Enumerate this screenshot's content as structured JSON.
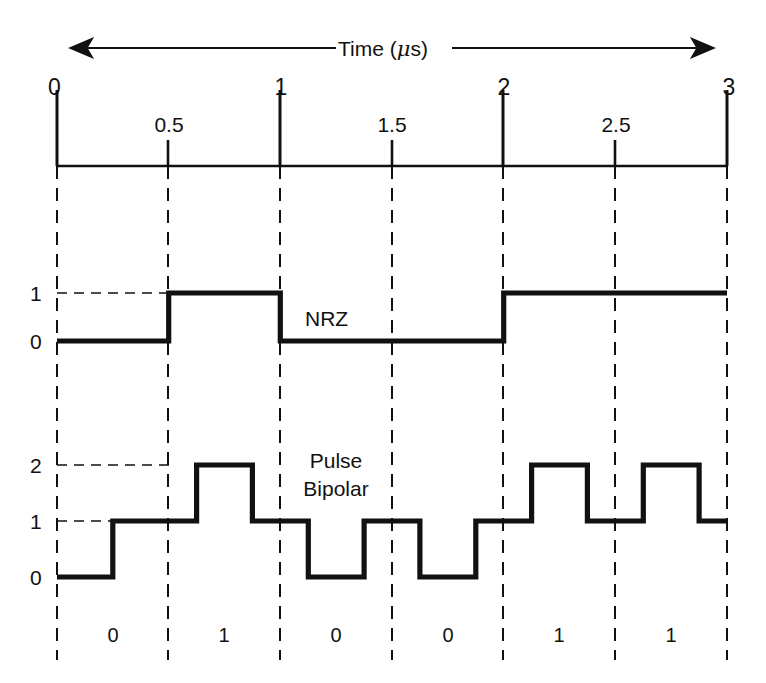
{
  "figure": {
    "background": "#ffffff",
    "ink": "#111111",
    "axis_title": "Time (",
    "axis_title_unit_mu": "μ",
    "axis_title_tail": "s)",
    "axis_title_full": "Time (μs)",
    "arrow_left_icon": "arrow-left-icon",
    "arrow_right_icon": "arrow-right-icon"
  },
  "axis": {
    "label": "Time (μs)",
    "unit": "μs",
    "major_ticks": [
      {
        "value": "0",
        "t": 0.0
      },
      {
        "value": "1",
        "t": 1.0
      },
      {
        "value": "2",
        "t": 2.0
      },
      {
        "value": "3",
        "t": 3.0
      }
    ],
    "minor_ticks": [
      {
        "value": "0.5",
        "t": 0.5
      },
      {
        "value": "1.5",
        "t": 1.5
      },
      {
        "value": "2.5",
        "t": 2.5
      }
    ],
    "range": [
      0,
      3
    ],
    "gridline_interval": 0.5
  },
  "signals": [
    {
      "name": "NRZ",
      "label": "NRZ",
      "y_labels": [
        "1",
        "0"
      ],
      "levels": [
        0,
        1
      ],
      "label_at_t": 1.22
    },
    {
      "name": "Pulse Bipolar",
      "label_line1": "Pulse",
      "label_line2": "Bipolar",
      "label": "Pulse Bipolar",
      "y_labels": [
        "2",
        "1",
        "0"
      ],
      "levels": [
        0,
        1,
        2
      ],
      "label_at_t": 1.48
    }
  ],
  "bits": [
    {
      "value": "0",
      "t_start": 0.0,
      "t_end": 0.5
    },
    {
      "value": "1",
      "t_start": 0.5,
      "t_end": 1.0
    },
    {
      "value": "0",
      "t_start": 1.0,
      "t_end": 1.5
    },
    {
      "value": "0",
      "t_start": 1.5,
      "t_end": 2.0
    },
    {
      "value": "1",
      "t_start": 2.0,
      "t_end": 2.5
    },
    {
      "value": "1",
      "t_start": 2.5,
      "t_end": 3.0
    }
  ],
  "chart_data": {
    "type": "line",
    "title": "",
    "xlabel": "Time (μs)",
    "ylabel": "",
    "xlim": [
      0,
      3
    ],
    "grid": true,
    "legend": "inline-annotation",
    "bit_sequence": [
      "0",
      "1",
      "0",
      "0",
      "1",
      "1"
    ],
    "bit_period_us": 0.5,
    "series": [
      {
        "name": "NRZ",
        "ylim": [
          0,
          1
        ],
        "ytick_values": [
          0,
          1
        ],
        "ytick_labels": [
          "0",
          "1"
        ],
        "description": "Non-return-to-zero: level held for the whole bit cell",
        "steps": [
          {
            "t": 0.0,
            "y": 0
          },
          {
            "t": 0.5,
            "y": 1
          },
          {
            "t": 1.0,
            "y": 0
          },
          {
            "t": 1.5,
            "y": 0
          },
          {
            "t": 2.0,
            "y": 1
          },
          {
            "t": 2.5,
            "y": 1
          },
          {
            "t": 3.0,
            "y": 1
          }
        ]
      },
      {
        "name": "Pulse Bipolar",
        "ylim": [
          0,
          2
        ],
        "ytick_values": [
          0,
          1,
          2
        ],
        "ytick_labels": [
          "0",
          "1",
          "2"
        ],
        "baseline": 1,
        "description": "Return-to-baseline pulses: a 1 bit pulses up to 2, a 0 bit pulses down to 0, each pulse occupying the middle half of the bit cell",
        "pulses": [
          {
            "bit": "0",
            "t_rise": 0.0,
            "t_fall": 0.25,
            "level": 0
          },
          {
            "bit": "1",
            "t_rise": 0.625,
            "t_fall": 0.875,
            "level": 2
          },
          {
            "bit": "0",
            "t_rise": 1.125,
            "t_fall": 1.375,
            "level": 0
          },
          {
            "bit": "0",
            "t_rise": 1.625,
            "t_fall": 1.875,
            "level": 0
          },
          {
            "bit": "1",
            "t_rise": 2.125,
            "t_fall": 2.375,
            "level": 2
          },
          {
            "bit": "1",
            "t_rise": 2.625,
            "t_fall": 2.875,
            "level": 2
          }
        ],
        "steps": [
          {
            "t": 0.0,
            "y": 0
          },
          {
            "t": 0.25,
            "y": 1
          },
          {
            "t": 0.625,
            "y": 2
          },
          {
            "t": 0.875,
            "y": 1
          },
          {
            "t": 1.125,
            "y": 0
          },
          {
            "t": 1.375,
            "y": 1
          },
          {
            "t": 1.625,
            "y": 0
          },
          {
            "t": 1.875,
            "y": 1
          },
          {
            "t": 2.125,
            "y": 2
          },
          {
            "t": 2.375,
            "y": 1
          },
          {
            "t": 2.625,
            "y": 2
          },
          {
            "t": 2.875,
            "y": 1
          },
          {
            "t": 3.0,
            "y": 1
          }
        ]
      }
    ]
  }
}
